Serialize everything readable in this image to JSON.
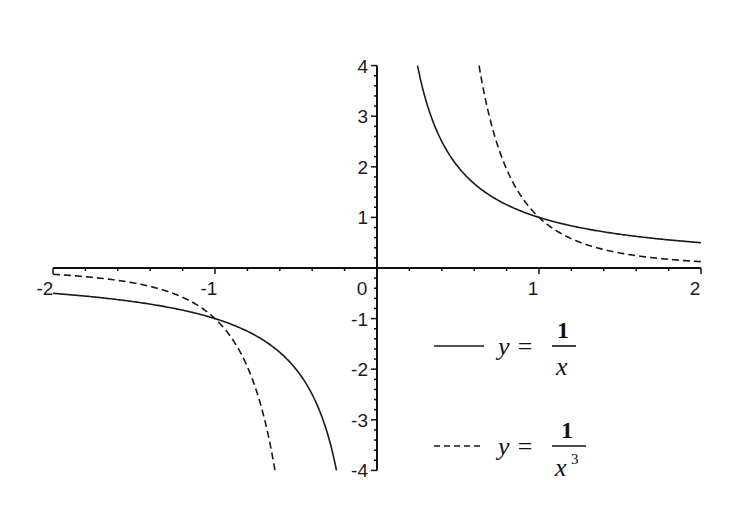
{
  "chart_data": {
    "type": "line",
    "title": "",
    "xlabel": "",
    "ylabel": "",
    "xlim": [
      -2,
      2
    ],
    "ylim": [
      -4,
      4
    ],
    "grid": false,
    "legend_position": "lower right",
    "x_ticks": [
      "-2",
      "-1",
      "0",
      "1",
      "2"
    ],
    "y_ticks": [
      "-4",
      "-3",
      "-2",
      "-1",
      "0",
      "1",
      "2",
      "3",
      "4"
    ],
    "series": [
      {
        "name": "y = 1/x",
        "style": "solid",
        "function": "1/x",
        "domain": [
          [
            -2,
            -0.25
          ],
          [
            0.25,
            2
          ]
        ],
        "sample_points": [
          [
            -2,
            -0.5
          ],
          [
            -1.5,
            -0.667
          ],
          [
            -1,
            -1
          ],
          [
            -0.5,
            -2
          ],
          [
            -0.333,
            -3
          ],
          [
            -0.25,
            -4
          ],
          [
            0.25,
            4
          ],
          [
            0.333,
            3
          ],
          [
            0.5,
            2
          ],
          [
            1,
            1
          ],
          [
            1.5,
            0.667
          ],
          [
            2,
            0.5
          ]
        ]
      },
      {
        "name": "y = 1/x^3",
        "style": "dashed",
        "function": "1/x^3",
        "domain": [
          [
            -2,
            -0.63
          ],
          [
            0.63,
            2
          ]
        ],
        "sample_points": [
          [
            -2,
            -0.125
          ],
          [
            -1.5,
            -0.296
          ],
          [
            -1,
            -1
          ],
          [
            -0.8,
            -1.953
          ],
          [
            -0.7,
            -2.915
          ],
          [
            -0.63,
            -4
          ],
          [
            0.63,
            4
          ],
          [
            0.7,
            2.915
          ],
          [
            0.8,
            1.953
          ],
          [
            1,
            1
          ],
          [
            1.5,
            0.296
          ],
          [
            2,
            0.125
          ]
        ]
      }
    ]
  },
  "legend": {
    "items": [
      {
        "lhs": "y =",
        "num": "1",
        "den": "x",
        "exp": ""
      },
      {
        "lhs": "y =",
        "num": "1",
        "den": "x",
        "exp": "3"
      }
    ]
  },
  "colors": {
    "line": "#1a1a1a",
    "axis": "#111111",
    "background": "#ffffff"
  }
}
